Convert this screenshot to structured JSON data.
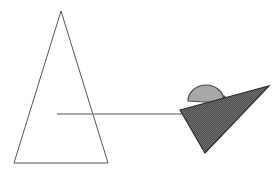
{
  "figure": {
    "title": "Geometric shapes line drawing",
    "width": 280,
    "height": 172,
    "background_color": "#ffffff"
  },
  "colors": {
    "background": "#ffffff",
    "outline_stroke": "#555555",
    "connector_line": "#8c8c8c",
    "dome_fill": "#a8a8a8",
    "dome_stroke": "#4a4a4a",
    "dark_triangle_fill": "#4f4f4f",
    "dark_triangle_hatch": "#6f6f6f",
    "dark_triangle_stroke": "#2b2b2b"
  },
  "shapes": {
    "outline_triangle": {
      "name": "large outlined triangle",
      "fill": "none",
      "stroke_width": 1,
      "points": "61,11 108,163 14,163"
    },
    "connector_line": {
      "name": "horizontal connector line",
      "x1": 57,
      "y1": 114,
      "x2": 184,
      "y2": 114,
      "stroke_width": 1.4
    },
    "dome": {
      "name": "light grey dome",
      "cx": 206,
      "cy": 100,
      "rx": 18,
      "ry": 16,
      "stroke_width": 1.2,
      "path": "M 188 101 A 18 16 0 0 1 224 101 L 224 96 L 228 100 L 222 103 Z"
    },
    "dark_triangle": {
      "name": "dark hatched triangle",
      "stroke_width": 1.2,
      "points": "180,110 269,86 205,153"
    }
  },
  "labels": {
    "figure_caption": "Geometric shapes line drawing"
  }
}
